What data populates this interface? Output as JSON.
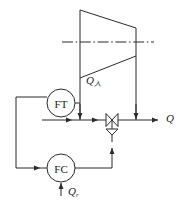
{
  "figure": {
    "kind": "process-flow-control-diagram",
    "line_color": "#2b2b2b",
    "text_color": "#1a1a1a",
    "background": "#ffffff"
  },
  "vessel": {
    "name": "trapezoid-vessel",
    "centerline_style": "dash-dot"
  },
  "instruments": [
    {
      "id": "ft",
      "tag": "FT",
      "name": "flow-transmitter",
      "cx": 61,
      "cy": 103,
      "r": 14
    },
    {
      "id": "fc",
      "tag": "FC",
      "name": "flow-controller",
      "cx": 61,
      "cy": 168,
      "r": 14
    }
  ],
  "valve": {
    "name": "control-valve",
    "type": "globe-valve-with-diaphragm-actuator"
  },
  "labels": {
    "steam_in": {
      "base": "Q",
      "sub": "入",
      "x": 86,
      "y": 75
    },
    "outlet": {
      "base": "Q",
      "sub": "",
      "x": 166,
      "y": 113
    },
    "setpoint": {
      "base": "Q",
      "sub": "r",
      "x": 68,
      "y": 186
    }
  },
  "caption": {
    "text": ""
  }
}
